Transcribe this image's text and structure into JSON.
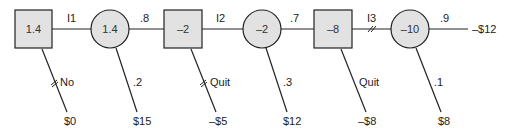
{
  "diagram": {
    "type": "decision-tree",
    "decision_nodes": [
      {
        "id": "d1",
        "value": "1.4"
      },
      {
        "id": "d2",
        "value": "–2"
      },
      {
        "id": "d3",
        "value": "–8"
      }
    ],
    "chance_nodes": [
      {
        "id": "c1",
        "value": "1.4"
      },
      {
        "id": "c2",
        "value": "–2"
      },
      {
        "id": "c3",
        "value": "–10"
      }
    ],
    "branches": {
      "d1_to_c1": "I1",
      "d2_to_c2": "I2",
      "d3_to_c3": "I3",
      "c1_to_d2": ".8",
      "c2_to_d3": ".7",
      "c3_main": ".9",
      "d1_alt": "No",
      "c1_alt": ".2",
      "d2_alt": "Quit",
      "c2_alt": ".3",
      "d3_alt": "Quit",
      "c3_alt": ".1"
    },
    "payoffs": {
      "d1_alt": "$0",
      "c1_alt": "$15",
      "d2_alt": "–$5",
      "c2_alt": "$12",
      "d3_alt": "–$8",
      "c3_alt": "$8",
      "c3_main": "–$12"
    },
    "colors": {
      "node_fill": "#e2e2e2",
      "stroke": "#222222"
    }
  }
}
